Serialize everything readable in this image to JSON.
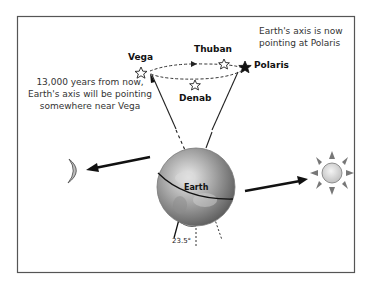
{
  "diagram": {
    "stars": [
      {
        "name": "Vega"
      },
      {
        "name": "Thuban"
      },
      {
        "name": "Polaris"
      },
      {
        "name": "Denab"
      }
    ],
    "labels": {
      "earth": "Earth",
      "tilt_angle": "23.5°"
    },
    "notes": {
      "future": [
        "13,000 years from now,",
        "Earth's axis will be pointing",
        "somewhere near Vega"
      ],
      "now": [
        "Earth's axis is now",
        "pointing at Polaris"
      ]
    },
    "icons": [
      "moon-icon",
      "sun-icon",
      "earth-globe",
      "star-icon",
      "arrow-icon"
    ],
    "colors": {
      "border": "#444444",
      "arrow": "#1a1a1a",
      "moon": "#b8b8b8",
      "sun": "#d8d8d8"
    }
  }
}
